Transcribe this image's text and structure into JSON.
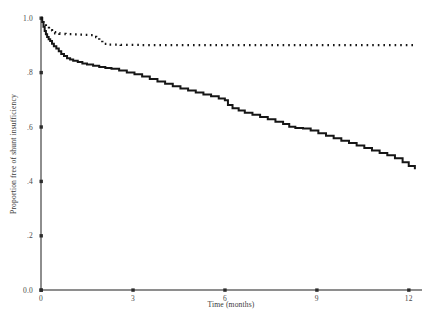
{
  "chart_data": {
    "type": "line",
    "title": "",
    "subtitle": "",
    "xlabel": "Time (months)",
    "ylabel": "Proportion free of shunt insufficiency",
    "xlim": [
      0,
      12.4
    ],
    "ylim": [
      0.0,
      1.0
    ],
    "xticks": [
      0,
      3,
      6,
      9,
      12
    ],
    "xtick_labels": [
      "0",
      "3",
      "6",
      "9",
      "12"
    ],
    "yticks": [
      0.0,
      0.2,
      0.4,
      0.6,
      0.8,
      1.0
    ],
    "ytick_labels": [
      "0.0",
      ".2",
      ".4",
      ".6",
      ".8",
      "1.0"
    ],
    "grid": false,
    "legend": "none",
    "curve_style": "kaplan-meier-step",
    "series": [
      {
        "name": "solid-curve",
        "style": "solid",
        "color": "#161616",
        "x": [
          0.0,
          0.04,
          0.08,
          0.12,
          0.16,
          0.2,
          0.25,
          0.3,
          0.36,
          0.42,
          0.5,
          0.58,
          0.66,
          0.75,
          0.85,
          0.95,
          1.05,
          1.2,
          1.35,
          1.5,
          1.7,
          1.9,
          2.1,
          2.3,
          2.55,
          2.8,
          3.05,
          3.3,
          3.55,
          3.8,
          4.05,
          4.3,
          4.55,
          4.8,
          5.05,
          5.3,
          5.55,
          5.8,
          6.0,
          6.1,
          6.25,
          6.45,
          6.65,
          6.9,
          7.15,
          7.4,
          7.65,
          7.9,
          8.1,
          8.3,
          8.55,
          8.8,
          9.05,
          9.3,
          9.55,
          9.8,
          10.05,
          10.3,
          10.55,
          10.8,
          11.05,
          11.3,
          11.55,
          11.8,
          12.0,
          12.2
        ],
        "y": [
          1.0,
          0.985,
          0.968,
          0.952,
          0.94,
          0.93,
          0.922,
          0.915,
          0.905,
          0.896,
          0.888,
          0.878,
          0.868,
          0.86,
          0.852,
          0.847,
          0.843,
          0.838,
          0.833,
          0.829,
          0.824,
          0.82,
          0.816,
          0.813,
          0.807,
          0.8,
          0.793,
          0.785,
          0.776,
          0.767,
          0.758,
          0.749,
          0.741,
          0.733,
          0.726,
          0.719,
          0.712,
          0.704,
          0.698,
          0.68,
          0.668,
          0.66,
          0.652,
          0.644,
          0.636,
          0.628,
          0.619,
          0.61,
          0.6,
          0.596,
          0.594,
          0.586,
          0.576,
          0.567,
          0.558,
          0.549,
          0.54,
          0.531,
          0.522,
          0.513,
          0.504,
          0.495,
          0.484,
          0.47,
          0.456,
          0.444
        ]
      },
      {
        "name": "dotted-curve",
        "style": "dotted",
        "color": "#161616",
        "x": [
          0.0,
          0.08,
          0.16,
          0.26,
          0.36,
          0.46,
          0.6,
          0.8,
          1.0,
          1.2,
          1.4,
          1.55,
          1.7,
          1.8,
          1.9,
          2.0,
          2.2,
          2.6,
          3.2,
          4.0,
          5.0,
          6.0,
          7.0,
          8.0,
          9.0,
          10.0,
          11.0,
          12.0,
          12.2
        ],
        "y": [
          1.0,
          0.982,
          0.968,
          0.955,
          0.948,
          0.944,
          0.942,
          0.941,
          0.94,
          0.939,
          0.938,
          0.937,
          0.936,
          0.93,
          0.918,
          0.905,
          0.902,
          0.901,
          0.9,
          0.9,
          0.9,
          0.9,
          0.9,
          0.9,
          0.9,
          0.9,
          0.9,
          0.9,
          0.9
        ]
      }
    ]
  },
  "plot_geometry": {
    "left_px": 41,
    "right_px": 421,
    "top_px": 18,
    "bottom_px": 290
  }
}
